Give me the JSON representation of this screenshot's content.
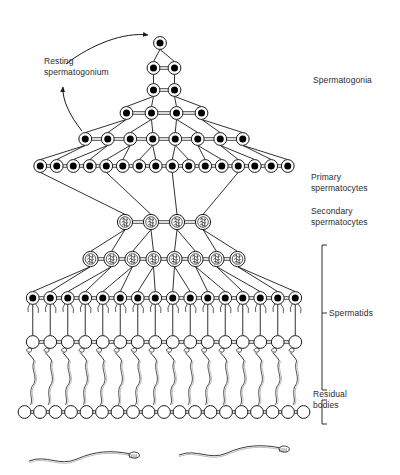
{
  "figure": {
    "background_color": "#ffffff",
    "ink_color": "#1a1a1a",
    "nucleus_color": "#000000",
    "cell_fill": "#ffffff"
  },
  "labels": {
    "resting_spermatogonium": "Resting\nspermatogonium",
    "spermatogonia": "Spermatogonia",
    "primary_spermatocytes": "Primary\nspermatocytes",
    "secondary_spermatocytes": "Secondary\nspermatocytes",
    "spermatids": "Spermatids",
    "residual_bodies": "Residual\nbodies"
  },
  "chart_data": {
    "type": "diagram",
    "rows": [
      {
        "stage": "spermatogonia",
        "row": 1,
        "count": 1,
        "nucleus": "filled",
        "y": 43,
        "spacing": 0,
        "center_x": 160
      },
      {
        "stage": "spermatogonia",
        "row": 2,
        "count": 2,
        "nucleus": "filled",
        "y": 68,
        "spacing": 21,
        "center_x": 164
      },
      {
        "stage": "spermatogonia",
        "row": 3,
        "count": 2,
        "nucleus": "filled",
        "y": 90,
        "spacing": 21,
        "center_x": 164
      },
      {
        "stage": "spermatogonia",
        "row": 4,
        "count": 4,
        "nucleus": "filled",
        "y": 113,
        "spacing": 25,
        "center_x": 164
      },
      {
        "stage": "spermatogonia",
        "row": 5,
        "count": 8,
        "nucleus": "filled",
        "y": 139,
        "spacing": 22.5,
        "center_x": 164
      },
      {
        "stage": "spermatogonia",
        "row": 6,
        "count": 16,
        "nucleus": "filled",
        "y": 166,
        "spacing": 16.5,
        "center_x": 164
      },
      {
        "stage": "primary_spermatocytes",
        "row": 7,
        "count": 4,
        "nucleus": "chromosomes",
        "y": 222,
        "spacing": 26,
        "center_x": 164
      },
      {
        "stage": "secondary_spermatocytes",
        "row": 8,
        "count": 8,
        "nucleus": "chromosomes",
        "y": 259,
        "spacing": 21,
        "center_x": 164
      },
      {
        "stage": "round_spermatids",
        "row": 9,
        "count": 16,
        "nucleus": "filled",
        "y": 298,
        "spacing": 17.5,
        "center_x": 164
      },
      {
        "stage": "elongating_spermatids",
        "row": 10,
        "count": 16,
        "nucleus": "empty",
        "y": 342,
        "spacing": 17.5,
        "center_x": 164
      },
      {
        "stage": "residual_bodies",
        "row": 11,
        "count": 19,
        "nucleus": "empty",
        "y": 412,
        "spacing": 15.5,
        "center_x": 164
      }
    ],
    "free_spermatozoa": [
      {
        "index": 1,
        "head_x": 137,
        "y": 456
      },
      {
        "index": 2,
        "head_x": 287,
        "y": 450
      }
    ],
    "brackets": [
      {
        "label": "spermatids",
        "x": 322,
        "y_top": 245,
        "y_bottom": 390,
        "tick_y": 313
      },
      {
        "label": "residual_bodies",
        "x": 322,
        "y_top": 400,
        "y_bottom": 424,
        "tick_y": 412
      }
    ],
    "arrows": [
      {
        "name": "to-top-cell",
        "from": [
          70,
          62
        ],
        "to": [
          150,
          36
        ]
      },
      {
        "name": "cycle-return",
        "from": [
          78,
          130
        ],
        "to": [
          63,
          85
        ]
      }
    ]
  }
}
